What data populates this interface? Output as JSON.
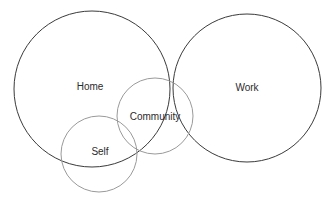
{
  "diagram": {
    "type": "venn-diagram",
    "background_color": "#ffffff",
    "canvas": {
      "width": 330,
      "height": 205
    },
    "label_color": "#2b2b2b",
    "label_font_size": 10,
    "sets": [
      {
        "id": "home",
        "label": "Home",
        "cx": 92,
        "cy": 89,
        "r": 78,
        "stroke": "#3a3a3a",
        "stroke_width": 1,
        "label_x": 90,
        "label_y": 87
      },
      {
        "id": "work",
        "label": "Work",
        "cx": 247,
        "cy": 88,
        "r": 74,
        "stroke": "#3a3a3a",
        "stroke_width": 1,
        "label_x": 247,
        "label_y": 88
      },
      {
        "id": "community",
        "label": "Community",
        "cx": 155,
        "cy": 116,
        "r": 38,
        "stroke": "#9a9a9a",
        "stroke_width": 1,
        "label_x": 155,
        "label_y": 117
      },
      {
        "id": "self",
        "label": "Self",
        "cx": 99,
        "cy": 154,
        "r": 38,
        "stroke": "#9a9a9a",
        "stroke_width": 1,
        "label_x": 100,
        "label_y": 152
      }
    ]
  }
}
